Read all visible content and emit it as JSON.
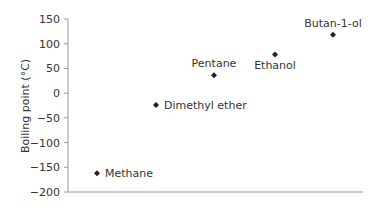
{
  "chart_data": {
    "type": "scatter",
    "title": "",
    "xlabel": "",
    "ylabel": "Boiling point (°C)",
    "ylim": [
      -200,
      150
    ],
    "yticks": [
      150,
      100,
      50,
      0,
      -50,
      -100,
      -150,
      -200
    ],
    "ytick_labels": [
      "150",
      "100",
      "50",
      "0",
      "−50",
      "−100",
      "−150",
      "−200"
    ],
    "grid": false,
    "legend": null,
    "marker": "diamond",
    "marker_color": "#222222",
    "points": [
      {
        "label": "Methane",
        "x": 1,
        "y": -162,
        "label_pos": "right"
      },
      {
        "label": "Dimethyl ether",
        "x": 2,
        "y": -24,
        "label_pos": "right"
      },
      {
        "label": "Pentane",
        "x": 3,
        "y": 36,
        "label_pos": "above"
      },
      {
        "label": "Ethanol",
        "x": 4,
        "y": 78,
        "label_pos": "below"
      },
      {
        "label": "Butan-1-ol",
        "x": 5,
        "y": 118,
        "label_pos": "above"
      }
    ]
  }
}
